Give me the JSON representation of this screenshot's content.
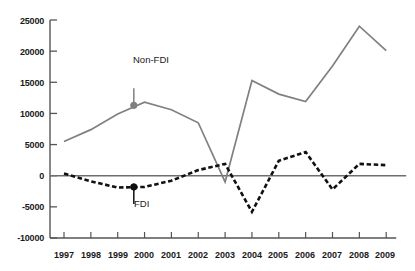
{
  "chart_data": {
    "type": "line",
    "title": "",
    "xlabel": "",
    "ylabel": "",
    "grid": false,
    "legend_position": "inline-annotations",
    "x": [
      1997,
      1998,
      1999,
      2000,
      2001,
      2002,
      2003,
      2004,
      2005,
      2006,
      2007,
      2008,
      2009
    ],
    "categories": [
      "1997",
      "1998",
      "1999",
      "2000",
      "2001",
      "2002",
      "2003",
      "2004",
      "2005",
      "2006",
      "2007",
      "2008",
      "2009"
    ],
    "ylim": [
      -10000,
      25000
    ],
    "ytick_labels": [
      "25000",
      "20000",
      "15000",
      "10000",
      "5000",
      "0",
      "-5000",
      "-10000"
    ],
    "ytick_values": [
      25000,
      20000,
      15000,
      10000,
      5000,
      0,
      -5000,
      -10000
    ],
    "zero_line": 0,
    "series": [
      {
        "name": "Non-FDI",
        "style": "solid",
        "color": "#808080",
        "marker_point": {
          "x": 1999.6,
          "y": 11300
        },
        "label": "Non-FDI",
        "values": [
          5500,
          7400,
          9900,
          11800,
          10600,
          8500,
          -1000,
          15300,
          13100,
          11900,
          17600,
          24000,
          20100
        ]
      },
      {
        "name": "FDI",
        "style": "dashed",
        "color": "#111111",
        "marker_point": {
          "x": 1999.6,
          "y": -1800
        },
        "label": "FDI",
        "values": [
          350,
          -900,
          -1900,
          -1800,
          -800,
          900,
          1900,
          -5800,
          2400,
          3800,
          -2200,
          1900,
          1700
        ]
      }
    ]
  },
  "axis": {
    "y_labels": [
      "25000",
      "20000",
      "15000",
      "10000",
      "5000",
      "0",
      "-5000",
      "-10000"
    ],
    "x_labels": [
      "1997",
      "1998",
      "1999",
      "2000",
      "2001",
      "2002",
      "2003",
      "2004",
      "2005",
      "2006",
      "2007",
      "2008",
      "2009"
    ]
  },
  "annotations": {
    "nonfdi_label": "Non-FDI",
    "fdi_label": "FDI"
  },
  "colors": {
    "nonfdi": "#808080",
    "fdi": "#111111",
    "axis": "#555555",
    "background": "#ffffff"
  }
}
